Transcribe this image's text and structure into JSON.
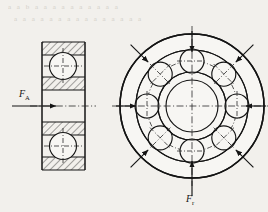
{
  "figure": {
    "background_color": "#f2f0ec",
    "line_color": "#141414",
    "labels": {
      "axial_force": {
        "symbol": "F",
        "subscript": "A",
        "text": "FA",
        "meaning": "axial force"
      },
      "radial_force": {
        "symbol": "F",
        "subscript": "r",
        "text": "Fr",
        "meaning": "radial force"
      }
    },
    "section_view": {
      "name": "bearing-section-view",
      "outer_width": 44,
      "outer_height": 140,
      "ball_count_visible": 2,
      "hatched_bands": 4,
      "has_centerline": true
    },
    "front_view": {
      "name": "bearing-front-view",
      "ball_count": 8,
      "ball_angles_deg": [
        90,
        45,
        0,
        315,
        270,
        225,
        180,
        135
      ],
      "circles": [
        "outer-ring-outside",
        "outer-ring-inside",
        "ball-pitch-circle",
        "inner-ring-outside",
        "bore"
      ],
      "radial_arrow_count": 8,
      "arrow_direction": "inward",
      "has_centerlines": true
    },
    "bleed_through_text": {
      "line1": "a a b a   a a a a a a a a a",
      "line2": "a a a a a   a a a a a a a a a a"
    }
  }
}
